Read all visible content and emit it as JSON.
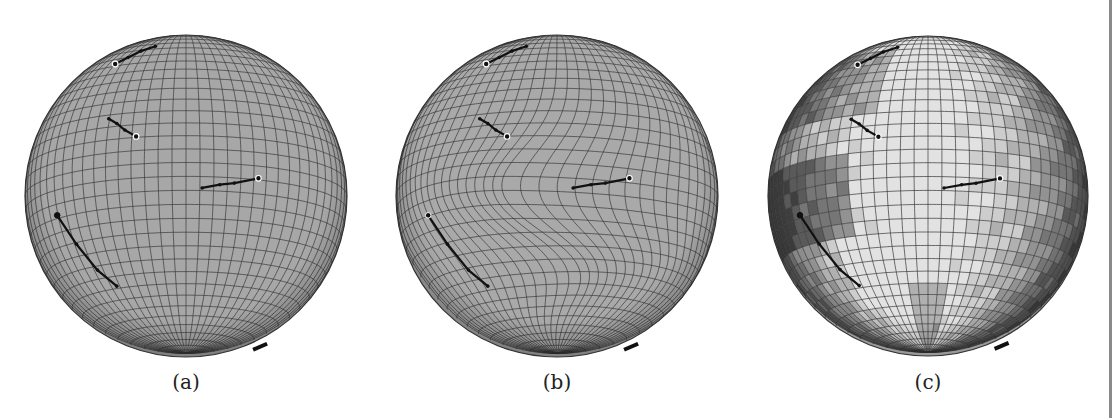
{
  "figure": {
    "panels": [
      {
        "id": "a",
        "caption": "(a)",
        "cx": 186,
        "cy": 196,
        "r": 161,
        "style": "uniform-grid",
        "fill": "#a7a7a7"
      },
      {
        "id": "b",
        "caption": "(b)",
        "cx": 557,
        "cy": 196,
        "r": 161,
        "style": "warped-grid",
        "fill": "#a9a9a9"
      },
      {
        "id": "c",
        "caption": "(c)",
        "cx": 928,
        "cy": 196,
        "r": 160,
        "style": "shaded-grid",
        "fill": "#c8c8c8"
      }
    ],
    "grid": {
      "meridians": 36,
      "parallels": 36,
      "line_color": "#3a3a3a"
    },
    "trajectories": [
      {
        "name": "top",
        "points": [
          [
            -0.44,
            -0.82
          ],
          [
            -0.36,
            -0.86
          ],
          [
            -0.28,
            -0.9
          ],
          [
            -0.19,
            -0.93
          ]
        ],
        "start_marker": "white"
      },
      {
        "name": "upper-left",
        "points": [
          [
            -0.48,
            -0.48
          ],
          [
            -0.43,
            -0.45
          ],
          [
            -0.38,
            -0.41
          ],
          [
            -0.31,
            -0.37
          ]
        ],
        "start_marker": "white-end"
      },
      {
        "name": "middle",
        "points": [
          [
            0.1,
            -0.05
          ],
          [
            0.21,
            -0.07
          ],
          [
            0.3,
            -0.08
          ],
          [
            0.45,
            -0.11
          ]
        ],
        "start_marker": "white-end"
      },
      {
        "name": "lower-left",
        "points": [
          [
            -0.8,
            0.12
          ],
          [
            -0.68,
            0.3
          ],
          [
            -0.55,
            0.46
          ],
          [
            -0.43,
            0.56
          ]
        ],
        "start_marker": "dark"
      }
    ],
    "bottom_mark": {
      "x": 0.46,
      "y": 0.93
    },
    "shading_colors": [
      "#3f3f3f",
      "#5a5a5a",
      "#767676",
      "#929292",
      "#b0b0b0",
      "#cdcdcd",
      "#e2e2e2"
    ]
  }
}
